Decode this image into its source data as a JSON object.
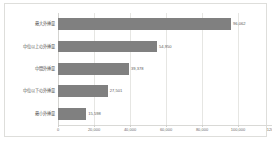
{
  "chart_data": {
    "type": "bar",
    "orientation": "horizontal",
    "title": "",
    "xlabel": "",
    "ylabel": "",
    "categories": [
      "最大外挿量",
      "中位以上の外挿量",
      "中間外挿量",
      "中位以下の外挿量",
      "最小外挿量"
    ],
    "values": [
      96062,
      54950,
      39378,
      27501,
      15598
    ],
    "value_labels": [
      "96,062",
      "54,950",
      "39,378",
      "27,501",
      "15,598"
    ],
    "xlim": [
      0,
      120000
    ],
    "xticks": [
      0,
      20000,
      40000,
      60000,
      80000,
      100000,
      120000
    ],
    "xtick_labels": [
      "0",
      "20,000",
      "40,000",
      "60,000",
      "80,000",
      "100,000",
      "120,000"
    ],
    "grid": true,
    "legend": false,
    "series": [
      {
        "name": "外挿量",
        "values": [
          96062,
          54950,
          39378,
          27501,
          15598
        ],
        "color": "#808080"
      }
    ],
    "colors": {
      "bar": "#808080",
      "gridline": "#e6e6e3",
      "axis": "#d4d4d1",
      "frame_border": "#dededb",
      "background": "#ffffff",
      "tick_text": "#6b6b6b",
      "label_text": "#555555",
      "value_text": "#5c5c5c"
    }
  }
}
